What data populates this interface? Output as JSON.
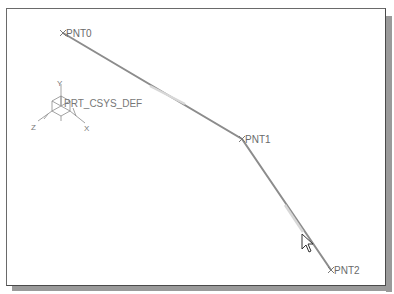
{
  "viewport": {
    "background": "#ffffff",
    "border_color": "#5a5a5a",
    "shadow_color": "#9a9a9a"
  },
  "datum_points": [
    {
      "name": "PNT0",
      "x": 63,
      "y": 33
    },
    {
      "name": "PNT1",
      "x": 242,
      "y": 139
    },
    {
      "name": "PNT2",
      "x": 331,
      "y": 270
    }
  ],
  "curve": {
    "color": "#8a8a8a",
    "highlight_color": "#d6d6d6"
  },
  "csys": {
    "label": "PRT_CSYS_DEF",
    "axes": {
      "x": "X",
      "y": "Y",
      "z": "Z"
    }
  },
  "cursor": {
    "icon": "arrow-pointer-icon",
    "x": 302,
    "y": 234
  }
}
